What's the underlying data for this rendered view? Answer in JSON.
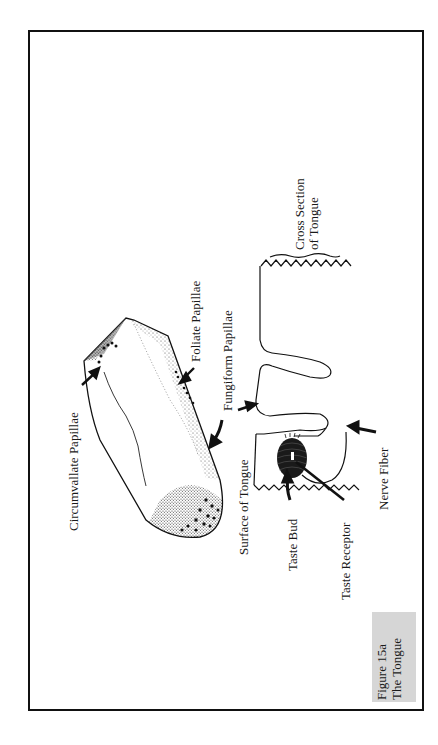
{
  "figure": {
    "caption_line1": "Figure 15a",
    "caption_line2": "The Tongue",
    "orientation": "rotated 90° counter-clockwise"
  },
  "labels": {
    "circumvallate": "Circumvallate Papillae",
    "foliate": "Foliate Papillae",
    "fungiform": "Fungiform Papillae",
    "cross_section_line1": "Cross Section",
    "cross_section_line2": "of Tongue",
    "surface": "Surface of Tongue",
    "taste_bud": "Taste Bud",
    "taste_receptor": "Taste Receptor",
    "nerve_fiber": "Nerve Fiber"
  },
  "colors": {
    "ink": "#111111",
    "caption_bg": "#d6d6d6",
    "page": "#ffffff"
  }
}
